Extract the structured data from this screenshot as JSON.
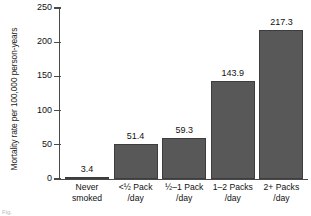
{
  "chart_data": {
    "type": "bar",
    "title": "",
    "xlabel": "",
    "ylabel": "Mortality rate per 100,000 person-years",
    "categories": [
      "Never smoked",
      "<½ Pack /day",
      "½–1 Pack /day",
      "1–2 Packs /day",
      "2+ Packs /day"
    ],
    "category_lines": [
      [
        "Never",
        "smoked"
      ],
      [
        "<½ Pack",
        "/day"
      ],
      [
        "½–1 Pack",
        "/day"
      ],
      [
        "1–2 Packs",
        "/day"
      ],
      [
        "2+ Packs",
        "/day"
      ]
    ],
    "values": [
      3.4,
      51.4,
      59.3,
      143.9,
      217.3
    ],
    "value_labels": [
      "3.4",
      "51.4",
      "59.3",
      "143.9",
      "217.3"
    ],
    "ylim": [
      0,
      250
    ],
    "yticks": [
      0,
      50,
      100,
      150,
      200,
      250
    ],
    "ytick_labels": [
      "0",
      "50",
      "100",
      "150",
      "200",
      "250"
    ],
    "grid": false,
    "legend": null,
    "bar_color": "#585858",
    "axis_color": "#4a4a4a",
    "text_color": "#111111",
    "background": "#ffffff"
  },
  "caption": {
    "text": "Fig."
  }
}
